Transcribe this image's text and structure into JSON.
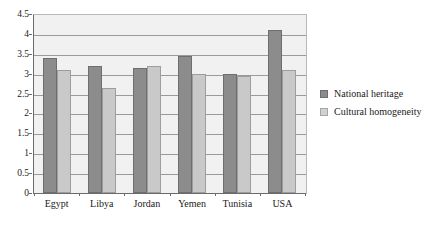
{
  "chart_data": {
    "type": "bar",
    "title": "",
    "subtitle": "",
    "xlabel": "",
    "ylabel": "",
    "categories": [
      "Egypt",
      "Libya",
      "Jordan",
      "Yemen",
      "Tunisia",
      "USA"
    ],
    "series": [
      {
        "name": "National heritage",
        "color": "#8c8c8c",
        "values": [
          3.4,
          3.2,
          3.15,
          3.45,
          3.0,
          4.1
        ]
      },
      {
        "name": "Cultural homogeneity",
        "color": "#c9c9c9",
        "values": [
          3.1,
          2.65,
          3.2,
          3.0,
          2.95,
          3.1
        ]
      }
    ],
    "ylim": [
      0,
      4.5
    ],
    "ytick_labels": [
      "0",
      "0.5",
      "1",
      "1.5",
      "2",
      "2.5",
      "3",
      "3.5",
      "4",
      "4.5"
    ],
    "ytick_values": [
      0,
      0.5,
      1,
      1.5,
      2,
      2.5,
      3,
      3.5,
      4,
      4.5
    ],
    "grid": true,
    "grid_axis": "y",
    "legend_position": "right",
    "plot_background": "#f1f1f1"
  },
  "legend": {
    "items": [
      {
        "label": "National heritage"
      },
      {
        "label": "Cultural homogeneity"
      }
    ]
  }
}
